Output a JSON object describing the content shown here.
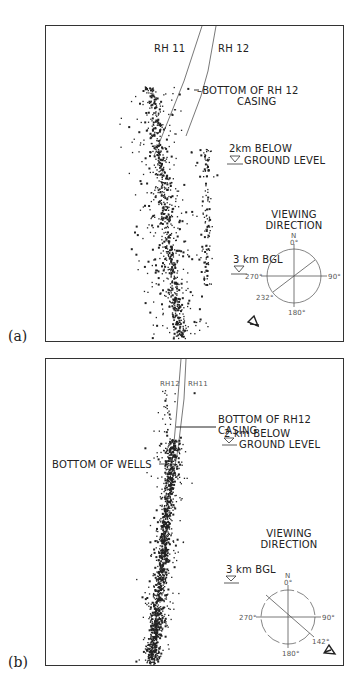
{
  "figure": {
    "panels": [
      {
        "id": "a",
        "label": "(a)",
        "wells": {
          "left": "RH 11",
          "right": "RH 12"
        },
        "annotations": {
          "casing_line1": "BOTTOM OF RH 12",
          "casing_line2": "CASING",
          "depth2_line1": "2km BELOW",
          "depth2_line2": "GROUND LEVEL",
          "depth3": "3 km BGL"
        },
        "compass": {
          "title_line1": "VIEWING",
          "title_line2": "DIRECTION",
          "north": "N",
          "deg_0": "0°",
          "deg_90": "90°",
          "deg_180": "180°",
          "deg_270": "270°",
          "view_deg": "232°",
          "view_azimuth": 232
        }
      },
      {
        "id": "b",
        "label": "(b)",
        "wells": {
          "left": "RH12",
          "right": "RH11"
        },
        "annotations": {
          "casing_line1": "BOTTOM OF RH12",
          "casing_line2": "CASING",
          "wells_bottom": "BOTTOM OF WELLS",
          "depth2_line1": "2 km BELOW",
          "depth2_line2": "GROUND LEVEL",
          "depth3": "3 km BGL"
        },
        "compass": {
          "title_line1": "VIEWING",
          "title_line2": "DIRECTION",
          "north": "N",
          "deg_0": "0°",
          "deg_90": "90°",
          "deg_180": "180°",
          "deg_270": "270°",
          "view_deg": "142°",
          "view_azimuth": 142
        }
      }
    ],
    "colors": {
      "ink": "#1a1a1a",
      "frame": "#333333",
      "background": "#ffffff"
    }
  }
}
